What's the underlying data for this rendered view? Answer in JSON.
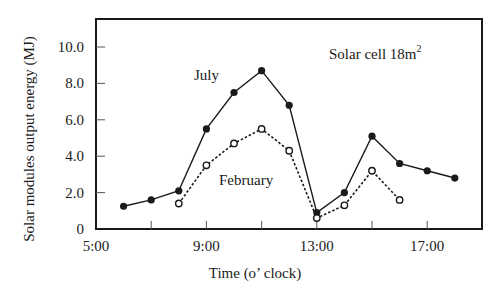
{
  "chart_data": {
    "type": "line",
    "title": "",
    "xlabel": "Time (o’ clock)",
    "ylabel": "Solar modules output energy (MJ)",
    "xlim": [
      5,
      19
    ],
    "ylim": [
      0,
      10.5
    ],
    "x_ticks": [
      5,
      7,
      9,
      11,
      13,
      15,
      17
    ],
    "x_tick_labels": [
      "5:00",
      "",
      "9:00",
      "",
      "13:00",
      "",
      "17:00"
    ],
    "y_ticks": [
      0,
      2,
      4,
      6,
      8,
      10
    ],
    "y_tick_labels": [
      "0",
      "2.0",
      "4.0",
      "6.0",
      "8.0",
      "10.0"
    ],
    "grid": false,
    "series": [
      {
        "name": "July",
        "style": "solid",
        "marker": "filled-circle",
        "x": [
          6,
          7,
          8,
          9,
          10,
          11,
          12,
          13,
          14,
          15,
          16,
          17,
          18
        ],
        "values": [
          1.25,
          1.6,
          2.1,
          5.5,
          7.5,
          8.7,
          6.8,
          0.9,
          2.0,
          5.1,
          3.6,
          3.2,
          2.8
        ]
      },
      {
        "name": "February",
        "style": "dotted",
        "marker": "open-circle",
        "x": [
          8,
          9,
          10,
          11,
          12,
          13,
          14,
          15,
          16
        ],
        "values": [
          1.4,
          3.5,
          4.7,
          5.5,
          4.3,
          0.6,
          1.3,
          3.2,
          1.6
        ]
      }
    ],
    "annotations": [
      {
        "text": "July",
        "x": 10.0,
        "y": 8.5
      },
      {
        "text": "February",
        "x": 10.3,
        "y": 2.1
      },
      {
        "text": "Solar cell 18m",
        "superscript": "2",
        "x": 15.5,
        "y": 9.4
      }
    ]
  },
  "labels": {
    "xlabel": "Time (o’ clock)",
    "ylabel": "Solar modules output energy (MJ)",
    "july": "July",
    "february": "February",
    "solar_cell": "Solar cell 18m",
    "solar_cell_sup": "2"
  },
  "colors": {
    "ink": "#1a1a1a",
    "background": "#ffffff"
  }
}
